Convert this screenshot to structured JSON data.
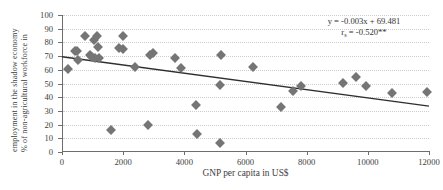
{
  "chart_data": {
    "type": "scatter",
    "title": "",
    "xlabel": "GNP per capita in US$",
    "ylabel_line1": "% of non-agricultural workforce in",
    "ylabel_line2": "employment in the shadow economy",
    "xlim": [
      0,
      12000
    ],
    "ylim": [
      0,
      100
    ],
    "xticks": [
      0,
      2000,
      4000,
      6000,
      8000,
      10000,
      12000
    ],
    "yticks": [
      0,
      10,
      20,
      30,
      40,
      50,
      60,
      70,
      80,
      90,
      100
    ],
    "grid": "horizontal-dotted",
    "legend": "none",
    "marker": "diamond",
    "marker_color": "#757575",
    "annotations": {
      "equation": "y = -0.003x + 69.481",
      "correlation_prefix": "r",
      "correlation_subscript": "s",
      "correlation_value": " = -0.520**"
    },
    "trendline": {
      "type": "linear",
      "slope": -0.003,
      "intercept": 69.481,
      "color": "#2e2e2e",
      "x_start": 0,
      "x_end": 12000,
      "y_start": 69.5,
      "y_end": 33.5
    },
    "points": [
      {
        "x": 200,
        "y": 60.5
      },
      {
        "x": 430,
        "y": 74.0
      },
      {
        "x": 480,
        "y": 73.5
      },
      {
        "x": 520,
        "y": 67.5
      },
      {
        "x": 760,
        "y": 85.0
      },
      {
        "x": 900,
        "y": 70.5
      },
      {
        "x": 980,
        "y": 69.0
      },
      {
        "x": 1050,
        "y": 81.5
      },
      {
        "x": 1080,
        "y": 68.5
      },
      {
        "x": 1150,
        "y": 84.5
      },
      {
        "x": 1180,
        "y": 76.5
      },
      {
        "x": 1200,
        "y": 68.5
      },
      {
        "x": 1600,
        "y": 16.0
      },
      {
        "x": 1880,
        "y": 76.0
      },
      {
        "x": 1990,
        "y": 75.5
      },
      {
        "x": 2000,
        "y": 84.5
      },
      {
        "x": 2400,
        "y": 62.0
      },
      {
        "x": 2800,
        "y": 20.0
      },
      {
        "x": 2870,
        "y": 71.0
      },
      {
        "x": 2980,
        "y": 72.5
      },
      {
        "x": 3700,
        "y": 68.5
      },
      {
        "x": 3900,
        "y": 61.5
      },
      {
        "x": 4380,
        "y": 34.5
      },
      {
        "x": 4400,
        "y": 13.0
      },
      {
        "x": 5150,
        "y": 6.5
      },
      {
        "x": 5180,
        "y": 49.0
      },
      {
        "x": 5200,
        "y": 71.0
      },
      {
        "x": 6250,
        "y": 62.0
      },
      {
        "x": 7150,
        "y": 33.0
      },
      {
        "x": 7560,
        "y": 44.5
      },
      {
        "x": 7800,
        "y": 48.5
      },
      {
        "x": 9180,
        "y": 50.5
      },
      {
        "x": 9600,
        "y": 55.0
      },
      {
        "x": 9950,
        "y": 48.5
      },
      {
        "x": 10800,
        "y": 43.0
      },
      {
        "x": 11950,
        "y": 44.0
      }
    ]
  }
}
